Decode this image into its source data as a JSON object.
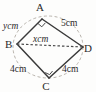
{
  "figure": {
    "type": "cyclic-quadrilateral-diagram",
    "title": "",
    "shape_name": "ABCD",
    "vertices": [
      {
        "id": "A",
        "label": "A",
        "x": 42,
        "y": 19,
        "label_x": 40,
        "label_y": 11,
        "right_angle": true
      },
      {
        "id": "B",
        "label": "B",
        "x": 17,
        "y": 44,
        "label_x": 5,
        "label_y": 48,
        "right_angle": false
      },
      {
        "id": "C",
        "label": "C",
        "x": 49,
        "y": 78,
        "label_x": 46,
        "label_y": 90,
        "right_angle": true
      },
      {
        "id": "D",
        "label": "D",
        "x": 83,
        "y": 47,
        "label_x": 84,
        "label_y": 52,
        "right_angle": false
      }
    ],
    "circle": {
      "cx": 48,
      "cy": 47,
      "rx": 35,
      "ry": 31,
      "style": "dashed"
    },
    "sides": [
      {
        "id": "AB",
        "from": "A",
        "to": "B",
        "style": "solid"
      },
      {
        "id": "AD",
        "from": "A",
        "to": "D",
        "style": "solid"
      },
      {
        "id": "BC",
        "from": "B",
        "to": "C",
        "style": "solid"
      },
      {
        "id": "CD",
        "from": "C",
        "to": "D",
        "style": "solid"
      }
    ],
    "diagonals": [
      {
        "id": "BD",
        "from": "B",
        "to": "D",
        "style": "dashed"
      }
    ],
    "measurements": [
      {
        "id": "AB",
        "variable": "y",
        "unit": "cm",
        "text": "ycm",
        "x": 3,
        "y": 29
      },
      {
        "id": "AD",
        "variable": "",
        "unit": "cm",
        "text": "5cm",
        "x": 61,
        "y": 26
      },
      {
        "id": "BD",
        "variable": "x",
        "unit": "cm",
        "text": "xcm",
        "x": 33,
        "y": 42
      },
      {
        "id": "BC",
        "variable": "",
        "unit": "cm",
        "text": "4cm",
        "x": 10,
        "y": 72
      },
      {
        "id": "CD",
        "variable": "",
        "unit": "cm",
        "text": "4cm",
        "x": 62,
        "y": 72
      }
    ],
    "colors": {
      "side_stroke": "#3a3a3a",
      "diagonal_stroke": "#4a4a4a",
      "circle_stroke": "#b9b4ad",
      "text": "#2b2b2b",
      "background": "#fdfdfc"
    }
  }
}
